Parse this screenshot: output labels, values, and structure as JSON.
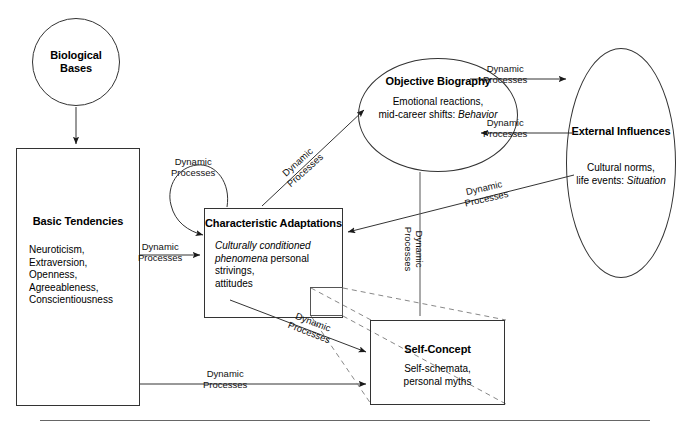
{
  "diagram": {
    "title_label": "Five-Factor Theory Personality System",
    "nodes": {
      "biological": {
        "shape": "circle",
        "title": "Biological\nBases",
        "title_line1": "Biological",
        "title_line2": "Bases",
        "subtitle": ""
      },
      "basic_tendencies": {
        "shape": "rect",
        "title_line1": "Basic",
        "title_line2": "Tendencies",
        "subtitle": "Neuroticism,\nExtraversion,\nOpenness,\nAgreeableness,\nConscientiousness"
      },
      "characteristic_adaptations": {
        "shape": "rect",
        "title_line1": "Characteristic",
        "title_line2": "Adaptations",
        "subtitle_italic": "Culturally conditioned\nphenomena",
        "subtitle_plain": "personal strivings,\nattitudes"
      },
      "objective_biography": {
        "shape": "ellipse",
        "title_line1": "Objective",
        "title_line2": "Biography",
        "subtitle_plain": "Emotional reactions,\nmid-career shifts:",
        "subtitle_italic": "Behavior"
      },
      "external_influences": {
        "shape": "ellipse",
        "title_line1": "External",
        "title_line2": "Influences",
        "subtitle_plain": "Cultural norms,\nlife events:",
        "subtitle_italic": "Situation"
      },
      "self_concept": {
        "shape": "rect",
        "title": "Self-Concept",
        "subtitle": "Self-schemata,\npersonal myths"
      }
    },
    "edge_labels": {
      "loop": {
        "line1": "Dynamic",
        "line2": "Processes"
      },
      "basic_to_charadapt": {
        "line1": "Dynamic",
        "line2": "Processes"
      },
      "charadapt_to_objbio": {
        "line1": "Dynamic",
        "line2": "Processes"
      },
      "objbio_to_external": {
        "line1": "Dynamic",
        "line2": "Processes"
      },
      "external_to_objbio": {
        "line1": "Dynamic",
        "line2": "Processes"
      },
      "external_to_charadapt": {
        "line1": "Dynamic",
        "line2": "Processes"
      },
      "objbio_to_selfcon": {
        "line1": "Dynamic",
        "line2": "Processes"
      },
      "charadapt_to_selfcon": {
        "line1": "Dynamic",
        "line2": "Processes"
      },
      "basic_to_selfcon": {
        "line1": "Dynamic",
        "line2": "Processes"
      }
    },
    "colors": {
      "stroke": "#333333",
      "text": "#000000",
      "background": "#ffffff",
      "rule": "#666666"
    }
  }
}
